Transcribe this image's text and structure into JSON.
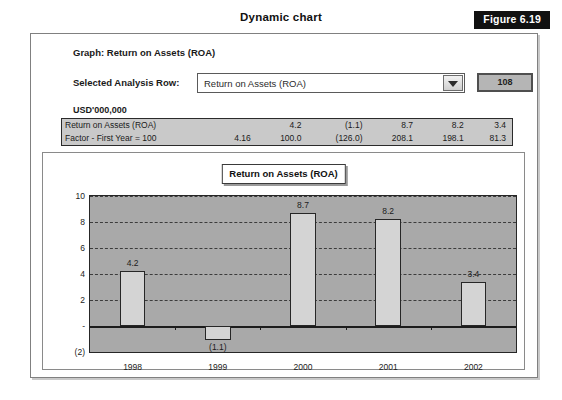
{
  "header": {
    "title": "Dynamic chart",
    "figure_badge": "Figure 6.19"
  },
  "panel": {
    "graph_caption": "Graph: Return on Assets (ROA)",
    "selector_label": "Selected Analysis Row:",
    "selected_value": "Return on Assets (ROA)",
    "dropdown_icon": "chevron-down-icon",
    "row_value_box": "108",
    "units_label": "USD'000,000"
  },
  "table": {
    "rows": [
      {
        "label": "Return on Assets (ROA)",
        "values": [
          "",
          "4.2",
          "(1.1)",
          "8.7",
          "8.2",
          "3.4"
        ]
      },
      {
        "label": "Factor - First Year = 100",
        "values": [
          "4.16",
          "100.0",
          "(126.0)",
          "208.1",
          "198.1",
          "81.3"
        ]
      }
    ]
  },
  "chart_data": {
    "type": "bar",
    "title": "Return on Assets (ROA)",
    "categories": [
      "1998",
      "1999",
      "2000",
      "2001",
      "2002"
    ],
    "values": [
      4.2,
      -1.1,
      8.7,
      8.2,
      3.4
    ],
    "data_labels": [
      "4.2",
      "(1.1)",
      "8.7",
      "8.2",
      "3.4"
    ],
    "ylabel": "",
    "xlabel": "",
    "ylim": [
      -2,
      10
    ],
    "yticks": [
      10,
      8,
      6,
      4,
      2,
      0,
      -2
    ],
    "ytick_labels": [
      "10",
      "8",
      "6",
      "4",
      "2",
      "-",
      "(2)"
    ],
    "grid": true,
    "legend": "none",
    "plot_bg": "#a9a9a9",
    "bar_color": "#d4d4d4",
    "bar_border": "#262626"
  }
}
